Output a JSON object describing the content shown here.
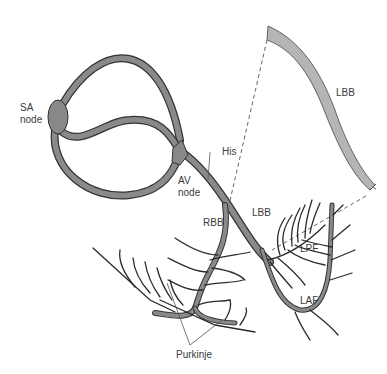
{
  "diagram": {
    "labels": {
      "sa_node_line1": "SA",
      "sa_node_line2": "node",
      "av_node_line1": "AV",
      "av_node_line2": "node",
      "his": "His",
      "rbb": "RBB",
      "lbb_main": "LBB",
      "lbb_inset": "LBB",
      "lpf": "LPF",
      "laf": "LAF",
      "purkinje": "Purkinje"
    },
    "colors": {
      "tube_fill": "#8a8a8a",
      "tube_outline": "#333333",
      "node_fill": "#888888",
      "inset_fill": "#b5b5b5",
      "fiber": "#2a2a2a",
      "label": "#3a3a3a"
    }
  }
}
